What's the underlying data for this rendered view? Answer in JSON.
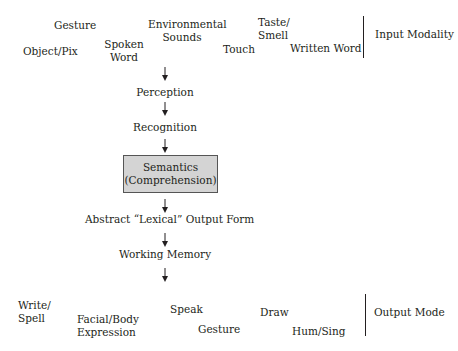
{
  "input_modality": {
    "label": "Input Modality",
    "items": {
      "gesture": "Gesture",
      "object_pix": "Object/Pix",
      "spoken_word_1": "Spoken",
      "spoken_word_2": "Word",
      "environmental_sounds_1": "Environmental",
      "environmental_sounds_2": "Sounds",
      "touch": "Touch",
      "taste_smell_1": "Taste/",
      "taste_smell_2": "Smell",
      "written_word": "Written Word"
    }
  },
  "stages": {
    "perception": "Perception",
    "recognition": "Recognition",
    "semantics_1": "Semantics",
    "semantics_2": "(Comprehension)",
    "lexical": "Abstract “Lexical” Output Form",
    "working_memory": "Working Memory"
  },
  "output_mode": {
    "label": "Output Mode",
    "items": {
      "write_spell_1": "Write/",
      "write_spell_2": "Spell",
      "facial_body_1": "Facial/Body",
      "facial_body_2": "Expression",
      "speak": "Speak",
      "gesture": "Gesture",
      "draw": "Draw",
      "hum_sing": "Hum/Sing"
    }
  },
  "colors": {
    "semantics_box_fill": "#d4d4d4",
    "text": "#231f20"
  }
}
